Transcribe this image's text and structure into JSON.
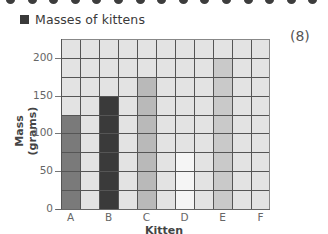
{
  "header": {
    "title": "Masses of kittens",
    "marks": "(8)"
  },
  "colors": {
    "grid_background": "#e3e3e3",
    "grid_lines": "#555555",
    "bar_A": "#7a7a7a",
    "bar_B": "#3a3a3a",
    "bar_C": "#b9b9b9",
    "bar_D": "#f5f5f5",
    "bar_E": "#c9c9c9",
    "binding_dots": "#3d3d3d"
  },
  "chart_data": {
    "type": "bar",
    "title": "Masses of kittens",
    "xlabel": "Kitten",
    "ylabel": "Mass (grams)",
    "categories": [
      "A",
      "B",
      "C",
      "D",
      "E",
      "F"
    ],
    "values": [
      125,
      150,
      175,
      75,
      200,
      null
    ],
    "ylim": [
      0,
      225
    ],
    "yticks": [
      0,
      50,
      100,
      150,
      200
    ],
    "grid": true,
    "grid_step_y": 25,
    "note": "Bar for kitten F is not drawn (to be completed)"
  },
  "axis": {
    "ylabel": "Mass (grams)",
    "xlabel": "Kitten",
    "yticks": [
      "0",
      "50",
      "100",
      "150",
      "200"
    ],
    "xticks": [
      "A",
      "B",
      "C",
      "D",
      "E",
      "F"
    ]
  }
}
